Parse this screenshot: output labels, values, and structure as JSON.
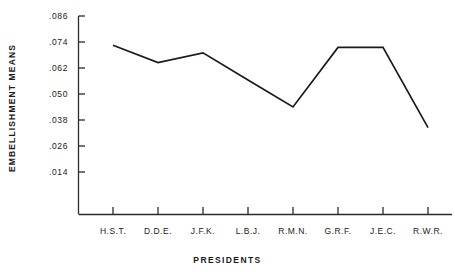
{
  "chart_data": {
    "type": "line",
    "title": "",
    "xlabel": "PRESIDENTS",
    "ylabel": "EMBELLISHMENT  MEANS",
    "categories": [
      "H.S.T.",
      "D.D.E.",
      "J.F.K.",
      "L.B.J.",
      "R.M.N.",
      "G.R.F.",
      "J.E.C.",
      "R.W.R."
    ],
    "values": [
      0.0725,
      0.0645,
      0.069,
      0.0565,
      0.044,
      0.0715,
      0.0715,
      0.0345
    ],
    "series": [
      {
        "name": "Embellishment means",
        "values": [
          0.0725,
          0.0645,
          0.069,
          0.0565,
          0.044,
          0.0715,
          0.0715,
          0.0345
        ]
      }
    ],
    "ytick_labels": [
      ".086",
      ".074",
      ".062",
      ".050",
      ".038",
      ".026",
      ".014"
    ],
    "ytick_values": [
      0.086,
      0.074,
      0.062,
      0.05,
      0.038,
      0.026,
      0.014
    ],
    "ylim": [
      0.008,
      0.086
    ],
    "xlim": [
      0,
      9
    ],
    "grid": false,
    "legend": false,
    "line_color": "#1a1a1a",
    "axis_color": "#2b2b2b",
    "markers": false
  }
}
